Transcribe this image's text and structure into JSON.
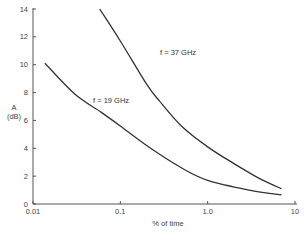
{
  "chart_data": {
    "type": "line",
    "title": "",
    "xlabel": "% of time",
    "ylabel_line1": "A",
    "ylabel_line2": "(dB)",
    "xscale": "log",
    "xlim": [
      0.01,
      10
    ],
    "ylim": [
      0,
      14
    ],
    "grid": false,
    "x_ticks": [
      0.01,
      0.1,
      1.0,
      10
    ],
    "x_tick_labels": [
      "0.01",
      "0.1",
      "1.0",
      "10"
    ],
    "y_ticks": [
      0,
      2,
      4,
      6,
      8,
      10,
      12,
      14
    ],
    "y_tick_labels": [
      "0",
      "2",
      "4",
      "6",
      "8",
      "10",
      "12",
      "14"
    ],
    "series": [
      {
        "name": "f = 37 GHz",
        "points": [
          [
            0.058,
            14.0
          ],
          [
            0.1,
            11.7
          ],
          [
            0.2,
            8.6
          ],
          [
            0.28,
            7.4
          ],
          [
            0.5,
            5.6
          ],
          [
            1.0,
            4.1
          ],
          [
            2.0,
            2.9
          ],
          [
            4.0,
            1.8
          ],
          [
            7.0,
            1.1
          ]
        ]
      },
      {
        "name": "f = 19 GHz",
        "points": [
          [
            0.0137,
            10.1
          ],
          [
            0.03,
            7.9
          ],
          [
            0.06,
            6.6
          ],
          [
            0.1,
            5.6
          ],
          [
            0.2,
            4.2
          ],
          [
            0.5,
            2.6
          ],
          [
            1.0,
            1.7
          ],
          [
            3.0,
            1.0
          ],
          [
            7.0,
            0.65
          ]
        ]
      }
    ],
    "annotations": [
      {
        "text": "f = 37 GHz",
        "series": 0
      },
      {
        "text": "f = 19 GHz",
        "series": 1
      }
    ]
  }
}
